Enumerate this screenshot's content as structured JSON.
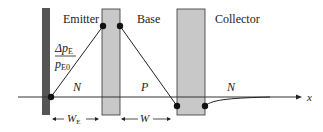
{
  "diagram": {
    "type": "bjt-minority-carrier-profile",
    "regions": {
      "emitter": {
        "label": "Emitter",
        "doping": "N"
      },
      "base": {
        "label": "Base",
        "doping": "P"
      },
      "collector": {
        "label": "Collector",
        "doping": "N"
      }
    },
    "y_axis_label": {
      "numerator": "Δp",
      "numerator_sub": "E",
      "denominator": "p",
      "denominator_sub": "E0"
    },
    "x_axis_label": "x",
    "widths": {
      "emitter": {
        "symbol": "W",
        "sub": "E"
      },
      "base": {
        "symbol": "W",
        "sub": ""
      }
    },
    "colors": {
      "contact": "#555555",
      "depletion": "#c8c8c8",
      "line": "#222222"
    }
  }
}
